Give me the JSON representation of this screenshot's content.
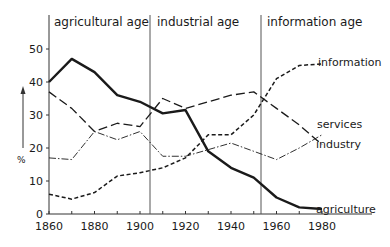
{
  "chart_data": {
    "type": "line",
    "title": "",
    "xlabel": "",
    "ylabel": "%",
    "x": [
      1860,
      1870,
      1880,
      1890,
      1900,
      1910,
      1920,
      1930,
      1940,
      1950,
      1960,
      1970,
      1980
    ],
    "xticks": [
      1860,
      1880,
      1900,
      1920,
      1940,
      1960,
      1980
    ],
    "yticks": [
      0,
      10,
      20,
      30,
      40,
      50
    ],
    "xlim": [
      1860,
      1985
    ],
    "ylim": [
      0,
      55
    ],
    "grid": false,
    "legend_position": "inline-right",
    "series": [
      {
        "name": "agriculture",
        "style": "solid-thick",
        "values": [
          40,
          47,
          43,
          36,
          34,
          30.5,
          31.5,
          19,
          14,
          11,
          5,
          2,
          1.5
        ]
      },
      {
        "name": "services",
        "style": "long-dash",
        "values": [
          37,
          32,
          25,
          27.5,
          26.5,
          35,
          32,
          34,
          36,
          37,
          32,
          27,
          21
        ]
      },
      {
        "name": "industry",
        "style": "dash-dot",
        "values": [
          17,
          16.5,
          25,
          22.5,
          25,
          17.5,
          17.5,
          19.5,
          21.5,
          19,
          16.5,
          20,
          24
        ]
      },
      {
        "name": "information",
        "style": "short-dash",
        "values": [
          6,
          4.5,
          6.5,
          11.5,
          12.5,
          14,
          17,
          24,
          24,
          30,
          41,
          45,
          45.5
        ]
      }
    ],
    "annotations": [
      {
        "text": "agricultural age",
        "x_range": [
          1860,
          1906
        ]
      },
      {
        "text": "industrial age",
        "x_range": [
          1906,
          1955
        ]
      },
      {
        "text": "information age",
        "x_range": [
          1955,
          1985
        ]
      }
    ],
    "dividers": [
      1906,
      1955
    ]
  },
  "labels": {
    "age_agricultural": "agricultural age",
    "age_industrial": "industrial age",
    "age_information": "information age",
    "y_unit": "%",
    "series_agriculture": "agriculture",
    "series_services": "services",
    "series_industry": "industry",
    "series_information": "information"
  }
}
